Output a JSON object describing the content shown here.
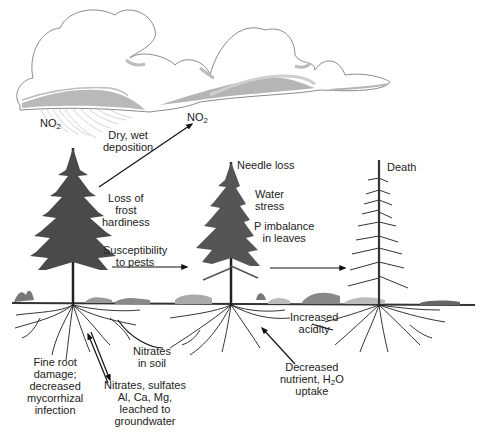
{
  "figure": {
    "topic": "Effects of acid deposition on coniferous trees",
    "colors": {
      "cloud_outline": "#8a8a8a",
      "cloud_shade": "#a8a8a8",
      "cloud_shade_light": "#cfcfcf",
      "tree": "#4a4a4a",
      "ground": "#333333",
      "roots": "#1e1e1e",
      "text": "#222222"
    }
  },
  "labels": {
    "no2_rain": {
      "main": "NO",
      "sub": "2"
    },
    "dry_wet": [
      "Dry, wet",
      "deposition"
    ],
    "no2_up": {
      "main": "NO",
      "sub": "2"
    },
    "frost": [
      "Loss of",
      "frost",
      "hardiness"
    ],
    "pests": [
      "Susceptibility",
      "to pests"
    ],
    "needle": "Needle loss",
    "water": [
      "Water",
      "stress"
    ],
    "p_imbalance": [
      "P imbalance",
      "in leaves"
    ],
    "death": "Death",
    "acidity": [
      "Increased",
      "acidity"
    ],
    "decreased": {
      "line1": "Decreased",
      "line2_pre": "nutrient, H",
      "line2_sub": "2",
      "line2_post": "O",
      "line3": "uptake"
    },
    "nitrates_soil": [
      "Nitrates",
      "in soil"
    ],
    "fine_root": [
      "Fine root",
      "damage;",
      "decreased",
      "mycorrhizal",
      "infection"
    ],
    "leached": [
      "Nitrates, sulfates",
      "Al, Ca, Mg,",
      "leached to",
      "groundwater"
    ]
  },
  "trees": [
    {
      "name": "healthy-tree",
      "stage": "healthy"
    },
    {
      "name": "stressed-tree",
      "stage": "stressed"
    },
    {
      "name": "dead-tree",
      "stage": "death"
    }
  ]
}
